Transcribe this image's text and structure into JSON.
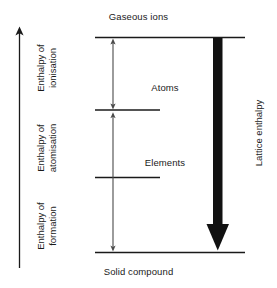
{
  "diagram": {
    "axis": {
      "name": "energy-axis",
      "direction": "upward",
      "label": ""
    },
    "levels": [
      {
        "id": "gaseous-ions",
        "label": "Gaseous ions",
        "position": "top"
      },
      {
        "id": "atoms",
        "label": "Atoms",
        "position": "upper-middle"
      },
      {
        "id": "elements",
        "label": "Elements",
        "position": "lower-middle"
      },
      {
        "id": "solid-compound",
        "label": "Solid compound",
        "position": "bottom"
      }
    ],
    "enthalpy_labels": [
      {
        "id": "enthalpy-of-ionisation",
        "line1": "Enthalpy of",
        "line2": "ionisation"
      },
      {
        "id": "enthalpy-of-atomisation",
        "line1": "Enthalpy of",
        "line2": "atomisation"
      },
      {
        "id": "enthalpy-of-formation",
        "line1": "Enthalpy of",
        "line2": "formation"
      }
    ],
    "lattice": {
      "id": "lattice-enthalpy",
      "label": "Lattice enthalpy"
    },
    "colors": {
      "ink": "#1a1a1a",
      "background": "#ffffff"
    }
  }
}
